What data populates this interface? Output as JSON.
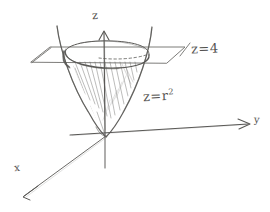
{
  "figure": {
    "medium": "pencil-sketch",
    "background_color": "#ffffff",
    "stroke_color": "#5a5956",
    "width": 270,
    "height": 212
  },
  "axes": {
    "z": {
      "label": "z",
      "direction": "up",
      "has_arrowhead": true
    },
    "y": {
      "label": "y",
      "direction": "right",
      "has_arrowhead": true
    },
    "x": {
      "label": "x",
      "direction": "down-left",
      "has_arrowhead": true
    },
    "origin_label": ""
  },
  "annotations": {
    "plane": {
      "label_prefix": "z",
      "equals": "=",
      "value": "4",
      "full": "z = 4"
    },
    "surface": {
      "label_prefix": "z",
      "equals": "=",
      "base": "r",
      "exponent": "2",
      "full": "z = r²"
    }
  },
  "shapes": {
    "paraboloid": {
      "name": "paraboloid",
      "equation": "z = r^2",
      "shading": "diagonal-hatching",
      "vertex_at_origin": true
    },
    "cutting_plane": {
      "name": "horizontal-plane",
      "equation": "z = 4",
      "outline": "parallelogram"
    },
    "intersection": {
      "name": "intersection-ellipse",
      "front_arc_style": "solid",
      "back_arc_style": "dashed"
    }
  }
}
